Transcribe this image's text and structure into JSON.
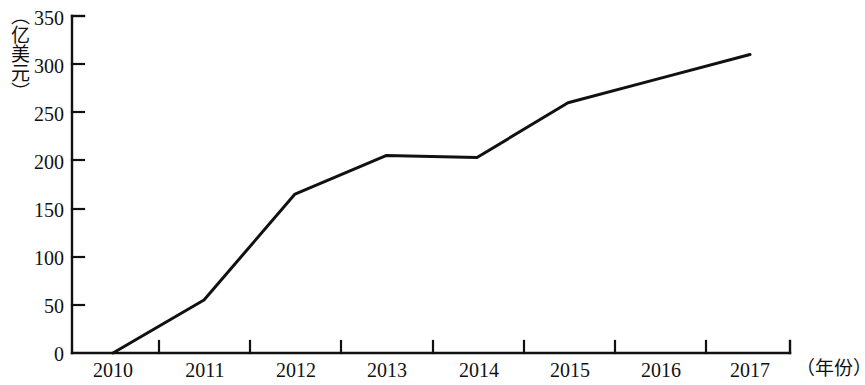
{
  "chart_data": {
    "type": "line",
    "title": "",
    "xlabel": "（年份）",
    "ylabel": "（亿美元）",
    "categories": [
      "2010",
      "2011",
      "2012",
      "2013",
      "2014",
      "2015",
      "2016",
      "2017"
    ],
    "values": [
      0,
      55,
      165,
      205,
      203,
      260,
      285,
      310
    ],
    "series": [
      {
        "name": "",
        "values": [
          0,
          55,
          165,
          205,
          203,
          260,
          285,
          310
        ]
      }
    ],
    "ylim": [
      0,
      350
    ],
    "yticks": [
      "0",
      "50",
      "100",
      "150",
      "200",
      "250",
      "300",
      "350"
    ],
    "ytick_values": [
      0,
      50,
      100,
      150,
      200,
      250,
      300,
      350
    ],
    "grid": false,
    "legend": "none",
    "line_color": "#111111",
    "axis_color": "#111111",
    "background_color": "#ffffff"
  },
  "axes": {
    "y_title": "（亿美元）",
    "x_title": "（年份）"
  }
}
